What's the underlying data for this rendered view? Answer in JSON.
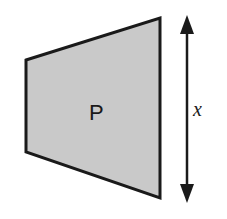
{
  "diagram": {
    "shape": {
      "type": "trapezoid",
      "label": "P",
      "fill_color": "#c9c9c9",
      "stroke_color": "#1a1a1a",
      "points": [
        [
          26,
          60
        ],
        [
          160,
          18
        ],
        [
          160,
          198
        ],
        [
          26,
          152
        ]
      ]
    },
    "dimension": {
      "type": "double-arrow",
      "label": "x",
      "x": 187,
      "y_start": 16,
      "y_end": 202,
      "color": "#1a1a1a"
    }
  }
}
